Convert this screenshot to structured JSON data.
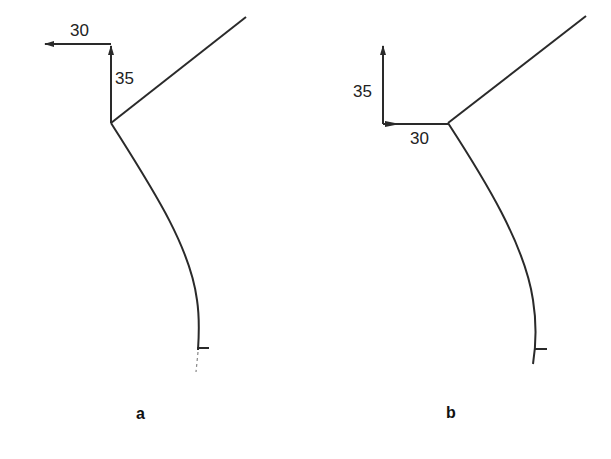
{
  "panels": [
    {
      "id": "a",
      "label": "a",
      "dimension_horizontal": "30",
      "dimension_vertical": "35",
      "horizontal_arrow_direction": "left",
      "vertical_arrow_direction": "up"
    },
    {
      "id": "b",
      "label": "b",
      "dimension_horizontal": "30",
      "dimension_vertical": "35",
      "horizontal_arrow_direction": "right",
      "vertical_arrow_direction": "up"
    }
  ],
  "colors": {
    "line": "#2a2a2a",
    "background": "#ffffff"
  }
}
